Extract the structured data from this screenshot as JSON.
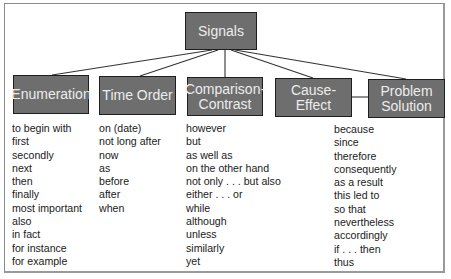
{
  "diagram": {
    "root": {
      "label": "Signals"
    },
    "categories": [
      {
        "label": "Enumeration",
        "items": [
          "to begin with",
          "first",
          "secondly",
          "next",
          "then",
          "finally",
          "most important",
          "also",
          "in fact",
          "for instance",
          "for example"
        ]
      },
      {
        "label": "Time Order",
        "items": [
          "on (date)",
          "not long after",
          "now",
          "as",
          "before",
          "after",
          "when"
        ]
      },
      {
        "label": "Comparison-\nContrast",
        "label_line1": "Comparison-",
        "label_line2": "Contrast",
        "items": [
          "however",
          "but",
          "as well as",
          "on the other hand",
          "not only . . . but also",
          "either . . . or",
          "while",
          "although",
          "unless",
          "similarly",
          "yet"
        ]
      },
      {
        "label": "Cause-Effect",
        "items": [
          "because",
          "since",
          "therefore",
          "consequently",
          "as a result",
          "this led to",
          "so that",
          "nevertheless",
          "accordingly",
          "if . . . then",
          "thus"
        ]
      },
      {
        "label": "Problem Solution",
        "label_line1": "Problem",
        "label_line2": "Solution",
        "items": []
      }
    ],
    "colors": {
      "box_fill": "#6e6e6e",
      "box_border": "#1e1e1e",
      "box_text": "#ececec",
      "line": "#333333"
    }
  }
}
